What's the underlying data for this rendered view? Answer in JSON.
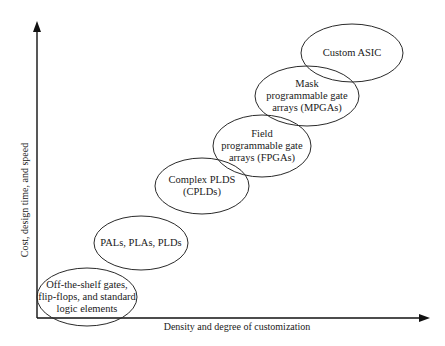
{
  "diagram": {
    "type": "positioning-chart",
    "x_axis": {
      "label": "Density and degree of customization"
    },
    "y_axis": {
      "label": "Cost, design time, and speed"
    },
    "nodes": [
      {
        "id": "off-the-shelf",
        "lines": [
          "Off-the-shelf gates,",
          "flip-flops, and standard",
          "logic elements"
        ],
        "cx": 87,
        "cy": 297,
        "rx": 50,
        "ry": 29
      },
      {
        "id": "pals",
        "lines": [
          "PALs, PLAs, PLDs"
        ],
        "cx": 141,
        "cy": 243,
        "rx": 47,
        "ry": 27
      },
      {
        "id": "cplds",
        "lines": [
          "Complex PLDS",
          "(CPLDs)"
        ],
        "cx": 202,
        "cy": 186,
        "rx": 47,
        "ry": 28
      },
      {
        "id": "fpgas",
        "lines": [
          "Field",
          "programmable gate",
          "arrays (FPGAs)"
        ],
        "cx": 262,
        "cy": 146,
        "rx": 49,
        "ry": 31
      },
      {
        "id": "mpgas",
        "lines": [
          "Mask",
          "programmable gate",
          "arrays (MPGAs)"
        ],
        "cx": 307,
        "cy": 96,
        "rx": 52,
        "ry": 30
      },
      {
        "id": "custom-asic",
        "lines": [
          "Custom ASIC"
        ],
        "cx": 352,
        "cy": 53,
        "rx": 51,
        "ry": 29
      }
    ]
  },
  "colors": {
    "background": "#ffffff",
    "stroke": "#2a2a2a",
    "text": "#1a1a1a"
  }
}
